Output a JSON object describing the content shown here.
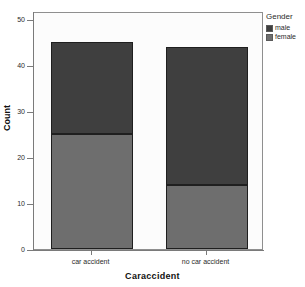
{
  "chart_data": {
    "type": "bar",
    "subtype": "stacked-bar",
    "title": "",
    "xlabel": "Caraccident",
    "ylabel": "Count",
    "categories": [
      "car accident",
      "no car accident"
    ],
    "series": [
      {
        "name": "female",
        "values": [
          25,
          14
        ],
        "color": "#6e6e6e"
      },
      {
        "name": "male",
        "values": [
          20,
          30
        ],
        "color": "#3f3f3f"
      }
    ],
    "stack_totals": [
      45,
      44
    ],
    "ylim": [
      0,
      50
    ],
    "yticks": [
      0,
      10,
      20,
      30,
      40,
      50
    ],
    "ytick_labels": [
      "0",
      "10",
      "20",
      "30",
      "40",
      "50"
    ],
    "grid": false,
    "legend": {
      "title": "Gender",
      "position": "top-right",
      "entries": [
        {
          "label": "male",
          "color": "#3f3f3f"
        },
        {
          "label": "female",
          "color": "#6e6e6e"
        }
      ]
    }
  },
  "axes": {
    "y_title": "Count",
    "x_title": "Caraccident",
    "y_tick_0": "0",
    "y_tick_10": "10",
    "y_tick_20": "20",
    "y_tick_30": "30",
    "y_tick_40": "40",
    "y_tick_50": "50",
    "x_tick_0": "car accident",
    "x_tick_1": "no car accident"
  },
  "legend": {
    "title": "Gender",
    "item_male": "male",
    "item_female": "female"
  },
  "colors": {
    "male": "#3f3f3f",
    "female": "#6e6e6e",
    "frame": "#8f8f8f",
    "plot_bg": "#fcfcfc",
    "page_bg": "#ffffff"
  }
}
